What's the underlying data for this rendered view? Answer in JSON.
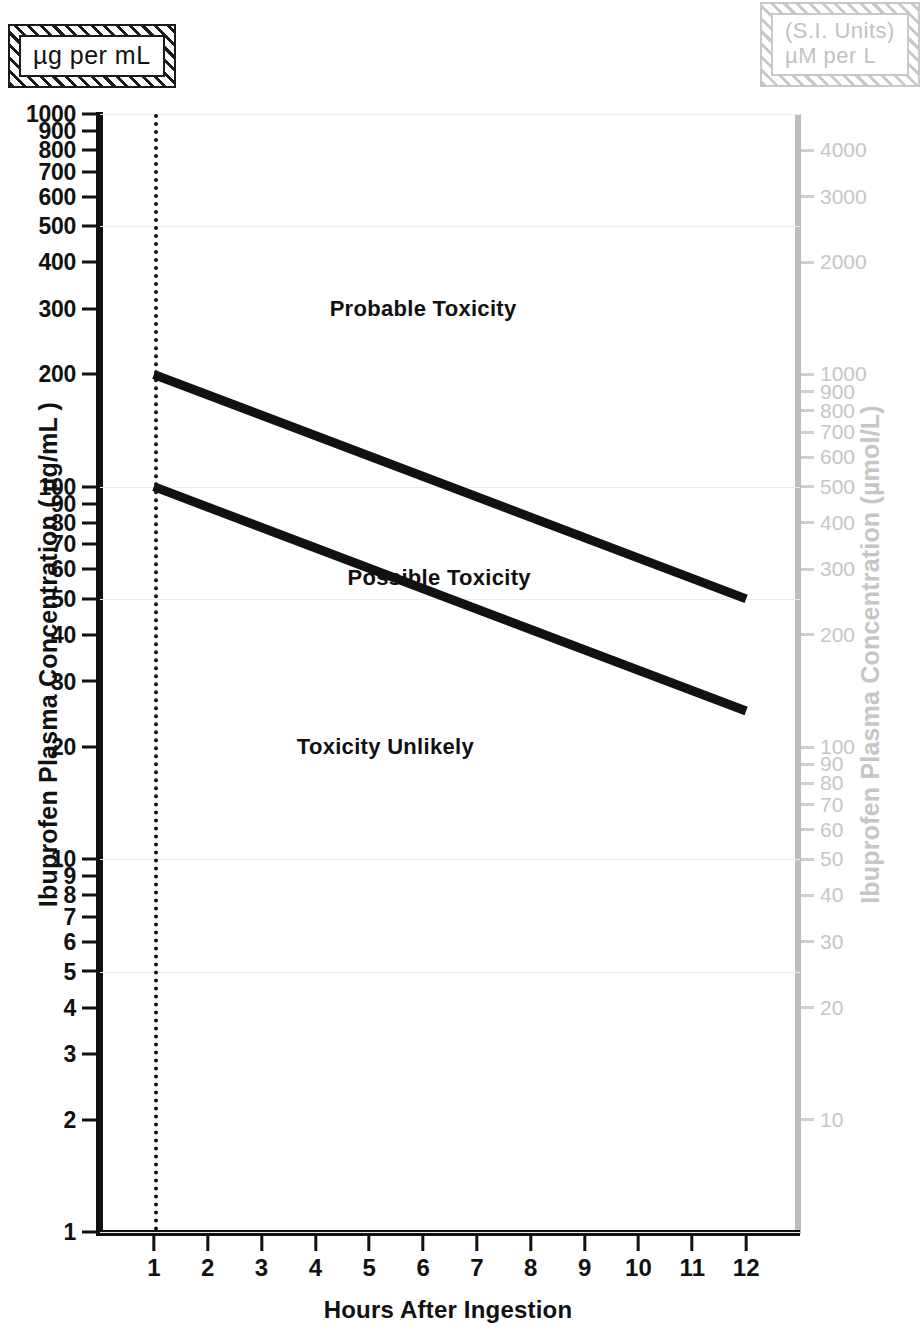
{
  "units_left": {
    "text": "µg per mL"
  },
  "units_right": {
    "line1": "(S.I. Units)",
    "line2": "µM per L"
  },
  "axes": {
    "x_title": "Hours After Ingestion",
    "y_title_left": "Ibuprofen Plasma Concentration ( µg/mL )",
    "y_title_right": "Ibuprofen Plasma Concentration (µmol/L)",
    "x_ticks": [
      "1",
      "2",
      "3",
      "4",
      "5",
      "6",
      "7",
      "8",
      "9",
      "10",
      "11",
      "12"
    ],
    "y_ticks_left": [
      "1",
      "2",
      "3",
      "4",
      "5",
      "6",
      "7",
      "8",
      "9",
      "10",
      "20",
      "30",
      "40",
      "50",
      "60",
      "70",
      "80",
      "90",
      "100",
      "200",
      "300",
      "400",
      "500",
      "600",
      "700",
      "800",
      "900",
      "1000"
    ],
    "y_ticks_right": [
      "10",
      "20",
      "30",
      "40",
      "50",
      "60",
      "70",
      "80",
      "90",
      "100",
      "200",
      "300",
      "400",
      "500",
      "600",
      "700",
      "800",
      "900",
      "1000",
      "2000",
      "3000",
      "4000"
    ]
  },
  "regions": [
    {
      "label": "Probable Toxicity"
    },
    {
      "label": "Possible Toxicity"
    },
    {
      "label": "Toxicity Unlikely"
    }
  ],
  "colors": {
    "line": "#111111",
    "right_axis": "#c6c6c6",
    "grid": "#ececec"
  },
  "chart_data": {
    "type": "line",
    "title": "",
    "xlabel": "Hours After Ingestion",
    "ylabel": "Ibuprofen Plasma Concentration (µg/mL)",
    "ylabel_secondary": "Ibuprofen Plasma Concentration (µmol/L)",
    "yscale": "log",
    "xlim": [
      0,
      13
    ],
    "ylim": [
      1,
      1000
    ],
    "ylim_secondary": [
      5,
      5000
    ],
    "grid": true,
    "legend": null,
    "x_ticks": [
      1,
      2,
      3,
      4,
      5,
      6,
      7,
      8,
      9,
      10,
      11,
      12
    ],
    "y_ticks_left": [
      1,
      2,
      3,
      4,
      5,
      6,
      7,
      8,
      9,
      10,
      20,
      30,
      40,
      50,
      60,
      70,
      80,
      90,
      100,
      200,
      300,
      400,
      500,
      600,
      700,
      800,
      900,
      1000
    ],
    "y_ticks_right": [
      10,
      20,
      30,
      40,
      50,
      60,
      70,
      80,
      90,
      100,
      200,
      300,
      400,
      500,
      600,
      700,
      800,
      900,
      1000,
      2000,
      3000,
      4000
    ],
    "series": [
      {
        "name": "Probable / Possible Toxicity boundary",
        "x": [
          1,
          12
        ],
        "values": [
          200,
          50
        ],
        "units": "µg/mL"
      },
      {
        "name": "Possible Toxicity / Toxicity Unlikely boundary",
        "x": [
          1,
          12
        ],
        "values": [
          100,
          25
        ],
        "units": "µg/mL"
      }
    ],
    "annotations": [
      {
        "text": "Probable Toxicity",
        "x": 6.0,
        "y": 300
      },
      {
        "text": "Possible Toxicity",
        "x": 6.3,
        "y": 57
      },
      {
        "text": "Toxicity Unlikely",
        "x": 5.3,
        "y": 20
      },
      {
        "text": "µg per mL",
        "x": null,
        "y": null
      },
      {
        "text": "(S.I. Units) µM per L",
        "x": null,
        "y": null
      }
    ],
    "vertical_marker": {
      "x": 1,
      "style": "dotted"
    }
  }
}
